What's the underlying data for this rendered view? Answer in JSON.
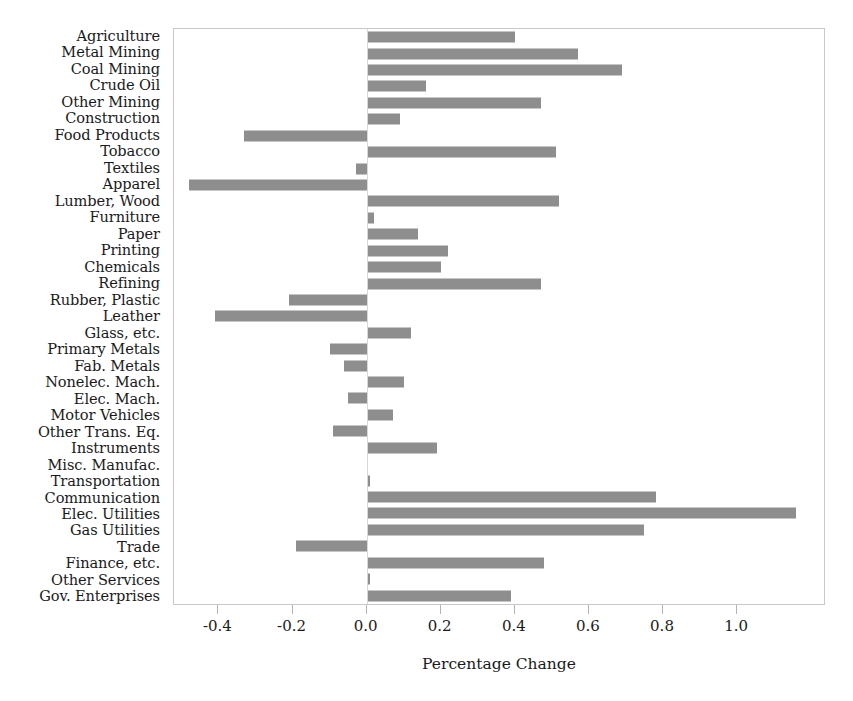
{
  "chart_data": {
    "type": "bar",
    "orientation": "horizontal",
    "title": "",
    "xlabel": "Percentage Change",
    "ylabel": "",
    "xlim": [
      -0.52,
      1.24
    ],
    "xticks": [
      -0.4,
      -0.2,
      0.0,
      0.2,
      0.4,
      0.6,
      0.8,
      1.0
    ],
    "xtick_labels": [
      "-0.4",
      "-0.2",
      "0.0",
      "0.2",
      "0.4",
      "0.6",
      "0.8",
      "1.0"
    ],
    "grid": false,
    "legend": null,
    "bar_color": "#8e8e8e",
    "zero_reference_line": 0.0,
    "categories": [
      "Agriculture",
      "Metal Mining",
      "Coal Mining",
      "Crude Oil",
      "Other Mining",
      "Construction",
      "Food Products",
      "Tobacco",
      "Textiles",
      "Apparel",
      "Lumber, Wood",
      "Furniture",
      "Paper",
      "Printing",
      "Chemicals",
      "Refining",
      "Rubber, Plastic",
      "Leather",
      "Glass, etc.",
      "Primary Metals",
      "Fab. Metals",
      "Nonelec. Mach.",
      "Elec. Mach.",
      "Motor Vehicles",
      "Other Trans. Eq.",
      "Instruments",
      "Misc. Manufac.",
      "Transportation",
      "Communication",
      "Elec. Utilities",
      "Gas Utilities",
      "Trade",
      "Finance, etc.",
      "Other Services",
      "Gov. Enterprises"
    ],
    "values": [
      0.4,
      0.57,
      0.69,
      0.16,
      0.47,
      0.09,
      -0.33,
      0.51,
      -0.03,
      -0.48,
      0.52,
      0.02,
      0.14,
      0.22,
      0.2,
      0.47,
      -0.21,
      -0.41,
      0.12,
      -0.1,
      -0.06,
      0.1,
      -0.05,
      0.07,
      -0.09,
      0.19,
      0.005,
      0.01,
      0.78,
      1.16,
      0.75,
      -0.19,
      0.48,
      0.01,
      0.39
    ]
  }
}
